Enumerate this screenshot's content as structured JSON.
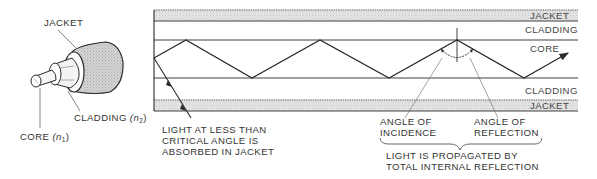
{
  "figure": {
    "colors": {
      "line": "#2a2a2a",
      "jacket_fill": "#dedede",
      "text": "#333333",
      "background": "#ffffff"
    }
  },
  "fiber_illustration": {
    "labels": {
      "jacket": "JACKET",
      "cladding": "CLADDING",
      "cladding_index": "(n",
      "cladding_index_sub": "2",
      "cladding_index_close": ")",
      "core": "CORE",
      "core_index": "(n",
      "core_index_sub": "1",
      "core_index_close": ")"
    }
  },
  "cross_section": {
    "layer_labels": {
      "top_jacket": "JACKET",
      "top_cladding": "CLADDING",
      "core": "CORE",
      "bottom_cladding": "CLADDING",
      "bottom_jacket": "JACKET"
    },
    "annotations": {
      "absorbed_line1": "LIGHT AT LESS THAN",
      "absorbed_line2": "CRITICAL ANGLE IS",
      "absorbed_line3": "ABSORBED IN JACKET",
      "incidence_line1": "ANGLE OF",
      "incidence_line2": "INCIDENCE",
      "reflection_line1": "ANGLE OF",
      "reflection_line2": "REFLECTION",
      "propagation_line1": "LIGHT IS PROPAGATED BY",
      "propagation_line2": "TOTAL INTERNAL REFLECTION"
    },
    "ray_path_points": [
      [
        154,
        58
      ],
      [
        186,
        40
      ],
      [
        252,
        78
      ],
      [
        320,
        40
      ],
      [
        389,
        78
      ],
      [
        457,
        40
      ],
      [
        524,
        78
      ],
      [
        568,
        53
      ]
    ]
  }
}
